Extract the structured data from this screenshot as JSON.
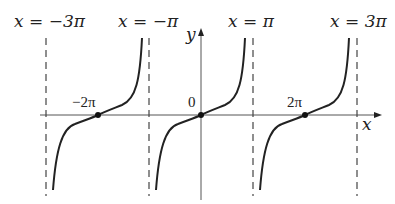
{
  "diagram": {
    "asymptote_labels": [
      "x = −3π",
      "x = −π",
      "x = π",
      "x = 3π"
    ],
    "axis_labels": {
      "x": "x",
      "y": "y"
    },
    "point_labels": [
      "−2π",
      "0",
      "2π"
    ],
    "colors": {
      "curve": "#222222",
      "axis": "#555555",
      "asymptote": "#444444"
    }
  }
}
